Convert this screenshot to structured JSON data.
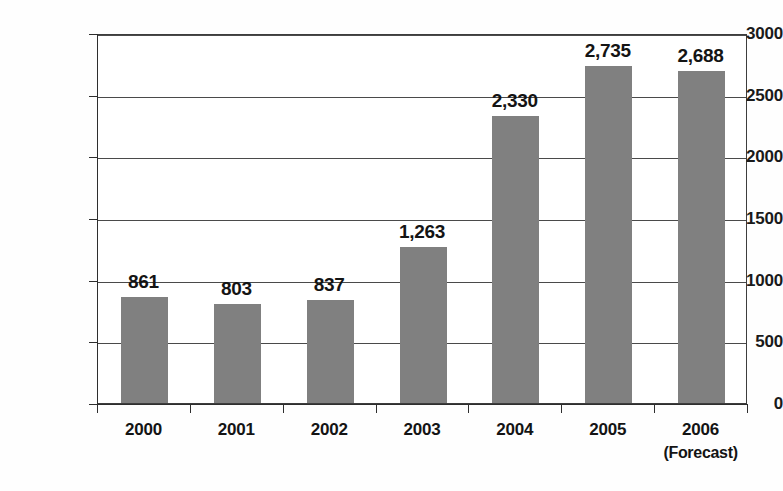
{
  "chart_data": {
    "type": "bar",
    "title": "",
    "subtitle": "",
    "xlabel": "",
    "ylabel": "",
    "categories": [
      "2000",
      "2001",
      "2002",
      "2003",
      "2004",
      "2005",
      "2006"
    ],
    "category_sublabels": [
      "",
      "",
      "",
      "",
      "",
      "",
      "(Forecast)"
    ],
    "values": [
      861,
      803,
      837,
      1263,
      2330,
      2735,
      2688
    ],
    "data_labels": [
      "861",
      "803",
      "837",
      "1,263",
      "2,330",
      "2,735",
      "2,688"
    ],
    "ylim": [
      0,
      3000
    ],
    "ytick_values": [
      0,
      500,
      1000,
      1500,
      2000,
      2500,
      3000
    ],
    "ytick_labels": [
      "0",
      "500",
      "1000",
      "1500",
      "2000",
      "2500",
      "3000"
    ],
    "grid": true,
    "grid_axis": "y",
    "legend": false,
    "legend_position": "none",
    "bar_color": "#808080",
    "axis_color": "#2e2e2e",
    "grid_color": "#4a4a4a",
    "text_color": "#141414",
    "background_color": "#ffffff"
  }
}
